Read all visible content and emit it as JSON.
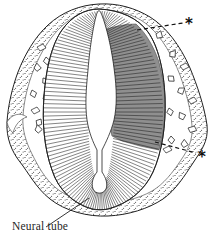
{
  "figure": {
    "label": "Neural tube",
    "annotations": [
      {
        "symbol": "*",
        "position": "upper-right"
      },
      {
        "symbol": "*",
        "position": "lower-right"
      }
    ]
  },
  "colors": {
    "ink": "#1f1f1f",
    "paper": "#ffffff",
    "shaded_region": "#8f8f8f",
    "stipple": "#2f2f2f",
    "inner_line": "#3a3a3a"
  }
}
